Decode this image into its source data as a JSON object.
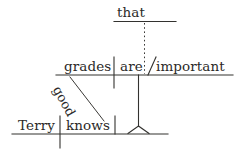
{
  "diagram": {
    "type": "reed-kellogg-sentence-diagram",
    "sentence": "Terry knows that grades are good important",
    "background_color": "#ffffff",
    "ink_color": "#2b2a28",
    "main_clause": {
      "subject": "Terry",
      "verb": "knows"
    },
    "subordinate_clause": {
      "conjunction": "that",
      "subject": "grades",
      "verb": "are",
      "predicate_adjective": "important",
      "modifier": "good"
    },
    "words": {
      "that": "that",
      "grades": "grades",
      "are": "are",
      "important": "important",
      "good": "good",
      "terry": "Terry",
      "knows": "knows"
    }
  }
}
